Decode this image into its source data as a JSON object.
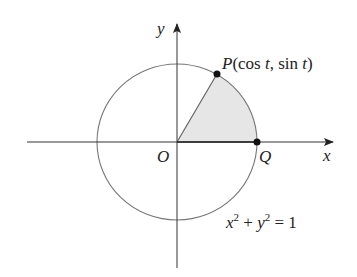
{
  "figure": {
    "axes": {
      "x_label": "x",
      "y_label": "y",
      "origin_label": "O"
    },
    "circle": {
      "equation_parts": {
        "x": "x",
        "exp1": "2",
        "plus": " + ",
        "y": "y",
        "exp2": "2",
        "eq": " = 1"
      }
    },
    "point_p": {
      "name": "P",
      "coords_open": "(cos ",
      "t1": "t",
      "mid": ", sin ",
      "t2": "t",
      "close": ")"
    },
    "point_q": {
      "name": "Q"
    },
    "colors": {
      "line": "#555555",
      "axis": "#333333",
      "shade": "#e6e6e6",
      "point": "#111111"
    }
  }
}
